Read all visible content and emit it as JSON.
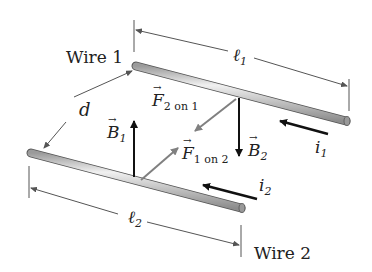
{
  "diagram": {
    "wire1": {
      "label": "Wire 1",
      "length_label": "ℓ",
      "length_sub": "1",
      "current_label": "i",
      "current_sub": "1"
    },
    "wire2": {
      "label": "Wire 2",
      "length_label": "ℓ",
      "length_sub": "2",
      "current_label": "i",
      "current_sub": "2"
    },
    "separation": {
      "label": "d"
    },
    "field1": {
      "label": "B",
      "sub": "1"
    },
    "field2": {
      "label": "B",
      "sub": "2"
    },
    "force21": {
      "label": "F",
      "sub": "2 on 1"
    },
    "force12": {
      "label": "F",
      "sub": "1 on 2"
    },
    "colors": {
      "wire": "#b8b8b8",
      "arrow_dark": "#111111",
      "arrow_gray": "#808080",
      "dim_line": "#555555"
    }
  }
}
